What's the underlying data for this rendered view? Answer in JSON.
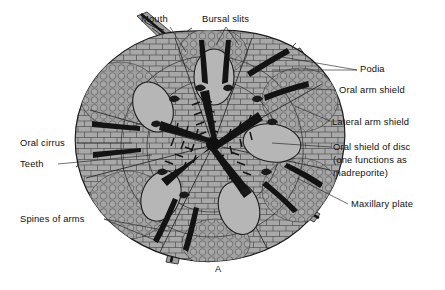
{
  "figure": {
    "caption": "A",
    "background_color": "#ffffff",
    "disc_fill": "#a9a9a9",
    "shield_fill": "#b4b4b4",
    "outline_color": "#1c1c1c",
    "dark_structure_color": "#141414"
  },
  "labels": {
    "mouth": {
      "text": "Mouth",
      "x": 141,
      "y": 22,
      "anchor": "start"
    },
    "bursal_slits": {
      "text": "Bursal slits",
      "x": 202,
      "y": 22,
      "anchor": "start"
    },
    "podia": {
      "text": "Podia",
      "x": 360,
      "y": 72,
      "anchor": "start"
    },
    "oral_arm_shield": {
      "text": "Oral arm shield",
      "x": 339,
      "y": 93,
      "anchor": "start"
    },
    "lateral_arm_shield": {
      "text": "Lateral arm shield",
      "x": 332,
      "y": 125,
      "anchor": "start"
    },
    "oral_shield_of_disc_line1": {
      "text": "Oral shield of disc",
      "x": 333,
      "y": 150,
      "anchor": "start"
    },
    "oral_shield_of_disc_line2": {
      "text": "(one functions as",
      "x": 333,
      "y": 163,
      "anchor": "start"
    },
    "oral_shield_of_disc_line3": {
      "text": "madreporite)",
      "x": 333,
      "y": 176,
      "anchor": "start"
    },
    "maxillary_plate": {
      "text": "Maxillary plate",
      "x": 351,
      "y": 207,
      "anchor": "start"
    },
    "oral_cirrus": {
      "text": "Oral cirrus",
      "x": 20,
      "y": 146,
      "anchor": "start"
    },
    "teeth": {
      "text": "Teeth",
      "x": 20,
      "y": 167,
      "anchor": "start"
    },
    "spines_of_arms": {
      "text": "Spines of arms",
      "x": 20,
      "y": 222,
      "anchor": "start"
    }
  },
  "leader_lines": {
    "mouth": "M 170 27 L 186 52",
    "bursal_slits": "M 226 27 L 216 45 M 226 27 L 239 45",
    "podia_a": "M 357 70 L 282 57",
    "podia_b": "M 357 70 L 272 70",
    "oral_arm_shield": "M 336 90 L 290 88",
    "lateral_arm_shield": "M 330 121 L 295 106",
    "oral_shield_of_disc": "M 331 147 L 272 143",
    "maxillary_plate": "M 348 204 L 297 178",
    "oral_cirrus": "M 77 143 L 132 143",
    "teeth": "M 58 164 L 152 155",
    "spines_of_arms_a": "M 104 219 L 168 231",
    "spines_of_arms_b": "M 104 219 L 162 243"
  },
  "structures": {
    "arm_count": 5,
    "oral_shield_count": 5,
    "bursal_slit_count": 10,
    "center_mouth": "five-rayed dark jaw star"
  }
}
